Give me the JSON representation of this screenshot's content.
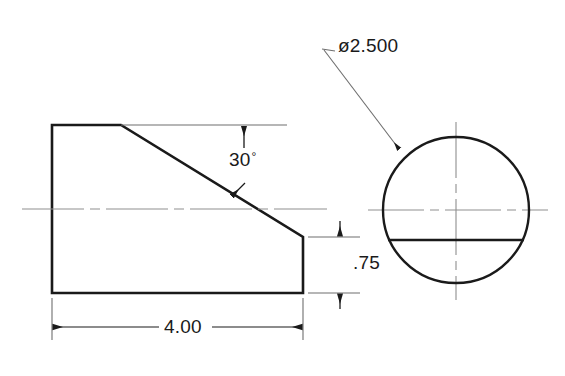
{
  "drawing": {
    "type": "engineering-drawing",
    "background_color": "#ffffff",
    "line_color": "#1a1a1a",
    "centerline_color": "#8a8a8a",
    "thin_line_color": "#6e6e6e",
    "views": {
      "profile": {
        "name": "front-profile-view",
        "description": "wedge shaped profile with chamfered top-right slant",
        "outline_points": "52,125 121,125 303,237 303,293 52,293",
        "left_edge": {
          "x": 52,
          "y1": 125,
          "y2": 293
        },
        "top_edge": {
          "y": 125,
          "x1": 52,
          "x2": 121
        },
        "slant_edge": {
          "x1": 121,
          "y1": 125,
          "x2": 303,
          "y2": 237
        },
        "right_edge": {
          "x": 303,
          "y1": 237,
          "y2": 293
        },
        "bottom_edge": {
          "y": 293,
          "x1": 52,
          "x2": 303
        },
        "centerline": {
          "y": 209,
          "x1": 22,
          "x2": 327
        }
      },
      "circular": {
        "name": "side-circular-view",
        "center_x": 456,
        "center_y": 210,
        "radius": 73,
        "chord_line_y": 240,
        "horizontal_centerline": {
          "y": 210,
          "x1": 368,
          "x2": 548
        },
        "vertical_centerline": {
          "x": 456,
          "y1": 122,
          "y2": 300
        }
      }
    },
    "dimensions": [
      {
        "name": "angle-dimension",
        "label": "30",
        "symbol": "°",
        "value": 30,
        "unit": "degrees",
        "reference_line": {
          "y": 125,
          "x1": 121,
          "x2": 285
        },
        "text_x": 229,
        "text_y": 150
      },
      {
        "name": "diameter-dimension",
        "label": "ø2.500",
        "value": 2.5,
        "unit": "inches",
        "leader_from": {
          "x": 325,
          "y": 50
        },
        "leader_to": {
          "x": 398,
          "y": 148
        },
        "text_x": 338,
        "text_y": 36
      },
      {
        "name": "height-dimension",
        "label": ".75",
        "value": 0.75,
        "unit": "inches",
        "arrow_top_y": 237,
        "arrow_bottom_y": 293,
        "dim_x": 340,
        "text_x": 353,
        "text_y": 253
      },
      {
        "name": "length-dimension",
        "label": "4.00",
        "value": 4.0,
        "unit": "inches",
        "arrow_left_x": 52,
        "arrow_right_x": 303,
        "dim_y": 327,
        "text_x": 159,
        "text_y": 317
      }
    ]
  }
}
